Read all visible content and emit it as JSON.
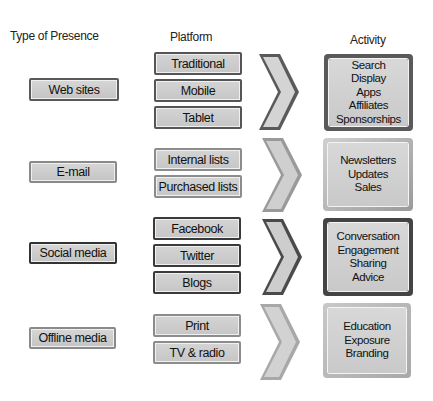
{
  "headers": {
    "type": "Type of Presence",
    "platform": "Platform",
    "activity": "Activity"
  },
  "rows": [
    {
      "type": "Web sites",
      "platforms": [
        "Traditional",
        "Mobile",
        "Tablet"
      ],
      "activities": [
        "Search",
        "Display",
        "Apps",
        "Affiliates",
        "Sponsorships"
      ]
    },
    {
      "type": "E-mail",
      "platforms": [
        "Internal lists",
        "Purchased lists"
      ],
      "activities": [
        "Newsletters",
        "Updates",
        "Sales"
      ]
    },
    {
      "type": "Social media",
      "platforms": [
        "Facebook",
        "Twitter",
        "Blogs"
      ],
      "activities": [
        "Conversation",
        "Engagement",
        "Sharing",
        "Advice"
      ]
    },
    {
      "type": "Offline media",
      "platforms": [
        "Print",
        "TV & radio"
      ],
      "activities": [
        "Education",
        "Exposure",
        "Branding"
      ]
    }
  ],
  "colors": {
    "box_fill": "#cccccc",
    "border_dark": "#3a3a3a",
    "border_light": "#8c8c8c",
    "arrow_dark": "#3c3c3c",
    "arrow_light": "#8a8a8a"
  }
}
